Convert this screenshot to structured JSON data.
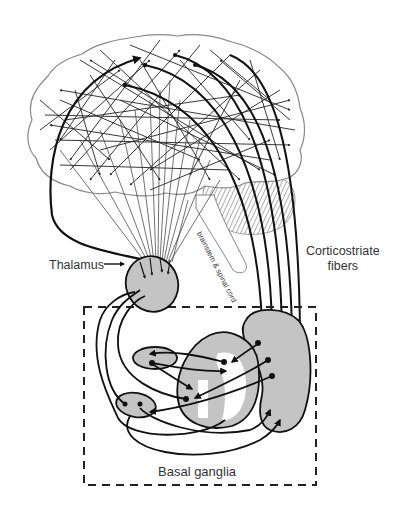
{
  "diagram": {
    "labels": {
      "thalamus": "Thalamus",
      "corticostriate_line1": "Corticostriate",
      "corticostriate_line2": "fibers",
      "basal_ganglia": "Basal ganglia",
      "brainstem": "brainstem & spinal cord"
    },
    "structures": [
      {
        "name": "cerebral-cortex",
        "shape": "brain outline with dense intracortical arrows"
      },
      {
        "name": "cerebellum",
        "shape": "hatched lobe"
      },
      {
        "name": "brainstem",
        "shape": "elongated tube"
      },
      {
        "name": "thalamus",
        "shape": "grey ellipse"
      },
      {
        "name": "striatum",
        "shape": "grey kidney shape"
      },
      {
        "name": "globus-pallidus",
        "shape": "grey rounded nucleus with white inner segments"
      },
      {
        "name": "subthalamic-nucleus",
        "shape": "small grey ellipse (upper)"
      },
      {
        "name": "substantia-nigra",
        "shape": "small grey ellipse (lower)"
      }
    ],
    "colors": {
      "nucleus_fill": "#c4c4c4",
      "stroke": "#111111",
      "outline": "#888888",
      "background": "#ffffff"
    }
  }
}
